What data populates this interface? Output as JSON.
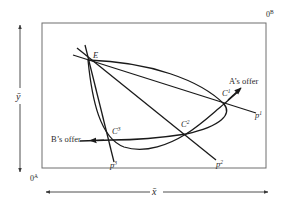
{
  "diagram": {
    "type": "edgeworth-box-offer-curves",
    "origins": {
      "a": {
        "base": "0",
        "sup": "A"
      },
      "b": {
        "base": "0",
        "sup": "B"
      }
    },
    "axes": {
      "x_label": "x̄",
      "y_label": "ȳ"
    },
    "endowment_label": "E",
    "points": [
      {
        "base": "C",
        "sup": "1"
      },
      {
        "base": "C",
        "sup": "2"
      },
      {
        "base": "C",
        "sup": "3"
      }
    ],
    "price_lines": [
      {
        "base": "p",
        "sup": "1"
      },
      {
        "base": "p",
        "sup": "2"
      },
      {
        "base": "p",
        "sup": "3"
      }
    ],
    "offer_curves": {
      "a_label": "A’s offer",
      "b_label": "B’s offer"
    },
    "colors": {
      "line": "#1a1a1a",
      "box": "#6e6e6e",
      "text": "#2a2a2a"
    }
  }
}
